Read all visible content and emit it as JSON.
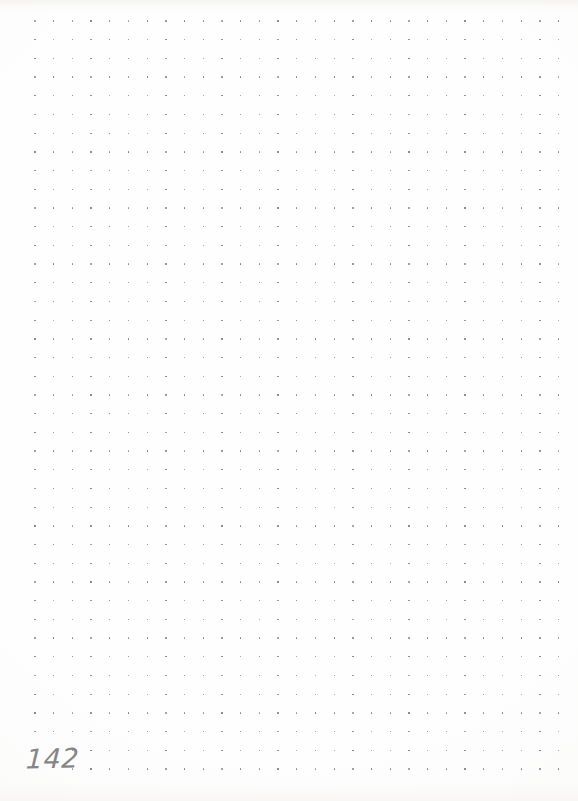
{
  "page": {
    "width": 578,
    "height": 801,
    "background_color": "#fefefe",
    "kind": "dot-grid-notebook-page",
    "content_note": "blank"
  },
  "dot_grid": {
    "dot_color": "#6e6e73",
    "dot_size_px": 1.4,
    "spacing_x_px": 18.7,
    "spacing_y_px": 18.7,
    "origin_x_px": 35,
    "origin_y_px": 21,
    "columns": 29,
    "rows": 41,
    "skipped_cells": [
      {
        "row": 39,
        "col": 0
      },
      {
        "row": 39,
        "col": 1
      },
      {
        "row": 40,
        "col": 0
      },
      {
        "row": 40,
        "col": 1
      }
    ]
  },
  "page_number": {
    "text": "142",
    "color": "#7b7b80",
    "x_px": 26,
    "y_px": 745,
    "font_size_px": 27,
    "style": "handwritten-pencil"
  }
}
